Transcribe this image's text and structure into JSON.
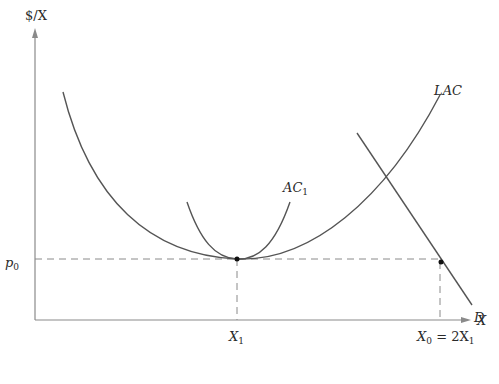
{
  "diagram": {
    "type": "economics cost curves",
    "y_axis_label": "$/X",
    "x_axis_label": "X",
    "price_label": {
      "base": "p",
      "sub": "0"
    },
    "x1_label": {
      "base": "X",
      "sub": "1"
    },
    "x0_label": {
      "base": "X",
      "sub0": "0",
      "eq": " = 2X",
      "sub1": "1"
    },
    "curves": [
      {
        "name": "LAC",
        "label": "LAC",
        "shape": "U-shaped long-run average cost"
      },
      {
        "name": "AC1",
        "label_base": "AC",
        "label_sub": "1",
        "shape": "short-run average cost tangent to LAC at X1"
      },
      {
        "name": "D",
        "label": "D",
        "shape": "downward-sloping demand line"
      }
    ],
    "points": [
      {
        "name": "tangency",
        "x": "X1",
        "y": "p0"
      },
      {
        "name": "demand-at-p0",
        "x": "X0 = 2X1",
        "y": "p0"
      }
    ],
    "colors": {
      "curve": "#555555",
      "axis": "#8a8a8a",
      "text": "#2a2a2a"
    }
  }
}
